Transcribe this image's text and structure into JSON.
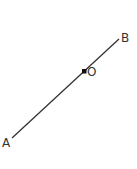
{
  "diagram": {
    "type": "line-segment",
    "segment": {
      "from": "A",
      "to": "B"
    },
    "points": [
      {
        "id": "A",
        "label": "A",
        "x": 12,
        "y": 138
      },
      {
        "id": "O",
        "label": "O",
        "x": 84,
        "y": 71,
        "marked": true
      },
      {
        "id": "B",
        "label": "B",
        "x": 119,
        "y": 39
      }
    ],
    "colors": {
      "line": "#333333",
      "point": "#111111",
      "label": "#333333"
    }
  }
}
